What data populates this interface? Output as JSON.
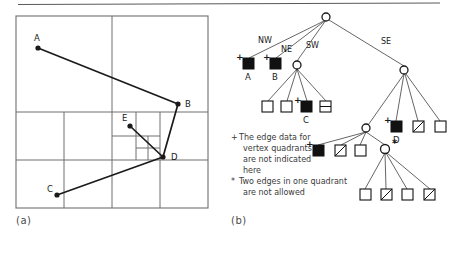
{
  "figure": {
    "top_rule": true,
    "panels": [
      {
        "id": "a",
        "caption": "(a)",
        "kind": "quadtree-subdivision"
      },
      {
        "id": "b",
        "caption": "(b)",
        "kind": "quadtree-tree"
      }
    ]
  },
  "panel_a": {
    "caption": "(a)",
    "vertices": [
      {
        "label": "A",
        "x": 14,
        "y": 16
      },
      {
        "label": "B",
        "x": 80,
        "y": 46
      },
      {
        "label": "C",
        "x": 14,
        "y": 86
      },
      {
        "label": "D",
        "x": 68,
        "y": 62
      },
      {
        "label": "E",
        "x": 47,
        "y": 48
      }
    ],
    "edges": [
      {
        "from": "A",
        "to": "B"
      },
      {
        "from": "B",
        "to": "D"
      },
      {
        "from": "D",
        "to": "C"
      },
      {
        "from": "E",
        "to": "D"
      }
    ]
  },
  "panel_b": {
    "caption": "(b)",
    "direction_labels": [
      "NW",
      "NE",
      "SW",
      "SE"
    ],
    "leaf_kinds": {
      "filled": "filled-square",
      "empty": "empty-square",
      "half": "half-split-square",
      "diagonal": "diagonal-split-square"
    },
    "vertex_leaves": [
      "A",
      "B",
      "C",
      "D",
      "E"
    ],
    "markers": {
      "plus": "+",
      "star": "*"
    },
    "nodes": [
      {
        "id": "root",
        "type": "internal"
      },
      {
        "id": "nw",
        "type": "leaf-filled",
        "label": "A",
        "marker": "+"
      },
      {
        "id": "ne",
        "type": "leaf-filled",
        "label": "B",
        "marker": "+"
      },
      {
        "id": "sw",
        "type": "internal"
      },
      {
        "id": "se",
        "type": "internal"
      },
      {
        "id": "sw1",
        "type": "leaf-empty"
      },
      {
        "id": "sw2",
        "type": "leaf-empty"
      },
      {
        "id": "sw3",
        "type": "leaf-filled",
        "label": "C",
        "marker": "+"
      },
      {
        "id": "sw4",
        "type": "leaf-half"
      },
      {
        "id": "se1",
        "type": "internal"
      },
      {
        "id": "se2",
        "type": "leaf-filled",
        "label": "D",
        "marker": "+"
      },
      {
        "id": "se3",
        "type": "leaf-diagonal"
      },
      {
        "id": "se4",
        "type": "leaf-empty"
      },
      {
        "id": "se1a",
        "type": "leaf-filled",
        "label": "E",
        "marker": "+"
      },
      {
        "id": "se1b",
        "type": "leaf-diagonal"
      },
      {
        "id": "se1c",
        "type": "leaf-empty"
      },
      {
        "id": "se1d",
        "type": "internal",
        "marker": "*"
      },
      {
        "id": "se1d1",
        "type": "leaf-empty"
      },
      {
        "id": "se1d2",
        "type": "leaf-diagonal"
      },
      {
        "id": "se1d3",
        "type": "leaf-empty"
      },
      {
        "id": "se1d4",
        "type": "leaf-diagonal"
      }
    ]
  },
  "legend": {
    "items": [
      {
        "marker": "+",
        "lines": [
          "The edge data for",
          "vertex quadrants",
          "are not indicated",
          "here"
        ]
      },
      {
        "marker": "*",
        "lines": [
          "Two edges in one quadrant",
          "are not allowed"
        ]
      }
    ]
  },
  "colors": {
    "ink": "#1a1a1a",
    "grid": "#6f6f6f",
    "rule": "#5a5a5a",
    "caption": "#4a4a4a",
    "paper": "#ffffff"
  }
}
